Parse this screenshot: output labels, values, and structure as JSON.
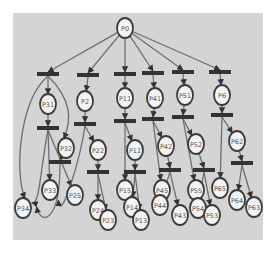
{
  "diagram": {
    "type": "petri-net",
    "colors": {
      "background": "#d4d4d4",
      "edge": "#6e6e6e",
      "transition": "#333333",
      "place_fill": "#f4f4f4",
      "place_stroke": "#3a3a3a",
      "label": "#555555"
    },
    "places": [
      {
        "id": "P0",
        "label": "P0"
      },
      {
        "id": "P31",
        "label": "P31"
      },
      {
        "id": "P2",
        "label": "P2"
      },
      {
        "id": "P11",
        "label": "P11"
      },
      {
        "id": "P41",
        "label": "P41"
      },
      {
        "id": "P51",
        "label": "P51"
      },
      {
        "id": "P6",
        "label": "P6"
      },
      {
        "id": "P32",
        "label": "P32"
      },
      {
        "id": "P22",
        "label": "P22"
      },
      {
        "id": "P12",
        "label": "P12"
      },
      {
        "id": "P42",
        "label": "P42"
      },
      {
        "id": "P52",
        "label": "P52"
      },
      {
        "id": "P62",
        "label": "P62"
      },
      {
        "id": "P33",
        "label": "P33"
      },
      {
        "id": "P25",
        "label": "P25"
      },
      {
        "id": "P34",
        "label": "P34"
      },
      {
        "id": "P24",
        "label": "P24"
      },
      {
        "id": "P23",
        "label": "P23"
      },
      {
        "id": "P15",
        "label": "P15"
      },
      {
        "id": "P14",
        "label": "P14"
      },
      {
        "id": "P13",
        "label": "P13"
      },
      {
        "id": "P45",
        "label": "P45"
      },
      {
        "id": "P44",
        "label": "P44"
      },
      {
        "id": "P43",
        "label": "P43"
      },
      {
        "id": "P55",
        "label": "P55"
      },
      {
        "id": "P54",
        "label": "P54"
      },
      {
        "id": "P53",
        "label": "P53"
      },
      {
        "id": "P65",
        "label": "P65"
      },
      {
        "id": "P64",
        "label": "P64"
      },
      {
        "id": "P63",
        "label": "P63"
      }
    ],
    "transitions": [
      "T1",
      "T2",
      "T3",
      "T4",
      "T5",
      "T6",
      "T7",
      "T8",
      "T9",
      "T10",
      "T11",
      "T12",
      "T13",
      "T14",
      "T15",
      "T16",
      "T17",
      "T18"
    ],
    "arcs": [
      [
        "P0",
        "T1"
      ],
      [
        "P0",
        "T2"
      ],
      [
        "P0",
        "T3"
      ],
      [
        "P0",
        "T4"
      ],
      [
        "P0",
        "T5"
      ],
      [
        "P0",
        "T6"
      ],
      [
        "T1",
        "P31"
      ],
      [
        "T1",
        "P32"
      ],
      [
        "T1",
        "P34"
      ],
      [
        "T2",
        "P2"
      ],
      [
        "T3",
        "P11"
      ],
      [
        "T4",
        "P41"
      ],
      [
        "T5",
        "P51"
      ],
      [
        "T6",
        "P6"
      ],
      [
        "P31",
        "T7"
      ],
      [
        "T7",
        "P33"
      ],
      [
        "T7",
        "P25"
      ],
      [
        "T7",
        "P34"
      ],
      [
        "P2",
        "T8"
      ],
      [
        "T8",
        "P22"
      ],
      [
        "T8",
        "P25"
      ],
      [
        "P11",
        "T9"
      ],
      [
        "T9",
        "P12"
      ],
      [
        "T9",
        "P15"
      ],
      [
        "P41",
        "T10"
      ],
      [
        "T10",
        "P42"
      ],
      [
        "T10",
        "P45"
      ],
      [
        "P51",
        "T11"
      ],
      [
        "T11",
        "P52"
      ],
      [
        "T11",
        "P55"
      ],
      [
        "P6",
        "T12"
      ],
      [
        "T12",
        "P62"
      ],
      [
        "T12",
        "P65"
      ],
      [
        "P22",
        "T13"
      ],
      [
        "T13",
        "P24"
      ],
      [
        "T13",
        "P23"
      ],
      [
        "P12",
        "T14"
      ],
      [
        "T14",
        "P14"
      ],
      [
        "T14",
        "P13"
      ],
      [
        "P42",
        "T15"
      ],
      [
        "T15",
        "P44"
      ],
      [
        "T15",
        "P43"
      ],
      [
        "P52",
        "T16"
      ],
      [
        "T16",
        "P54"
      ],
      [
        "T16",
        "P53"
      ],
      [
        "P62",
        "T17"
      ],
      [
        "T17",
        "P64"
      ],
      [
        "T17",
        "P63"
      ],
      [
        "P32",
        "T18"
      ],
      [
        "T18",
        "P34"
      ]
    ]
  }
}
